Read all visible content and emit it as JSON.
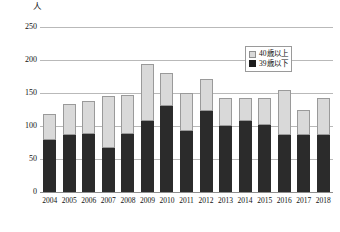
{
  "chart_data": {
    "type": "bar",
    "subtype": "stacked-vertical",
    "title": "",
    "xlabel": "",
    "ylabel": "",
    "unit_label": "人",
    "categories": [
      "2004",
      "2005",
      "2006",
      "2007",
      "2008",
      "2009",
      "2010",
      "2011",
      "2012",
      "2013",
      "2014",
      "2015",
      "2016",
      "2017",
      "2018"
    ],
    "series": [
      {
        "name": "39歳以下",
        "color": "#2b2b2b",
        "values": [
          79,
          87,
          88,
          67,
          88,
          108,
          131,
          92,
          123,
          100,
          107,
          101,
          86,
          86,
          86
        ]
      },
      {
        "name": "40歳以上",
        "color": "#d9d9d9",
        "values": [
          39,
          46,
          50,
          79,
          59,
          86,
          49,
          58,
          48,
          42,
          35,
          42,
          68,
          38,
          56
        ]
      }
    ],
    "totals": [
      118,
      133,
      138,
      146,
      147,
      194,
      180,
      150,
      171,
      142,
      142,
      143,
      154,
      124,
      142
    ],
    "stack_order": [
      "39歳以下",
      "40歳以上"
    ],
    "ylim": [
      0,
      250
    ],
    "yticks": [
      0,
      50,
      100,
      150,
      200,
      250
    ],
    "ytick_labels": [
      "0",
      "50",
      "100",
      "150",
      "200",
      "250"
    ],
    "grid": true,
    "grid_axis": "y",
    "legend": {
      "position": "upper-right-inside",
      "entries": [
        {
          "label": "40歳以上",
          "color": "#d9d9d9"
        },
        {
          "label": "39歳以下",
          "color": "#1d1d1d"
        }
      ]
    }
  }
}
